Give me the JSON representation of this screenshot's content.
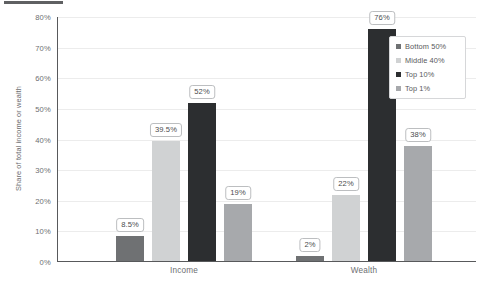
{
  "chart_data": {
    "type": "bar",
    "title": "",
    "xlabel": "",
    "ylabel": "Share of total income or wealth",
    "categories": [
      "Income",
      "Wealth"
    ],
    "series": [
      {
        "name": "Bottom 50%",
        "color": "#6f7173",
        "values": [
          8.5,
          2
        ],
        "labels": [
          "8.5%",
          "2%"
        ]
      },
      {
        "name": "Middle 40%",
        "color": "#d0d2d3",
        "values": [
          39.5,
          22
        ],
        "labels": [
          "39.5%",
          "22%"
        ]
      },
      {
        "name": "Top 10%",
        "color": "#2c2e30",
        "values": [
          52,
          76
        ],
        "labels": [
          "52%",
          "76%"
        ]
      },
      {
        "name": "Top 1%",
        "color": "#a7a9ac",
        "values": [
          19,
          38
        ],
        "labels": [
          "19%",
          "38%"
        ]
      }
    ],
    "ylim": [
      0,
      80
    ],
    "y_ticks": [
      "0%",
      "10%",
      "20%",
      "30%",
      "40%",
      "50%",
      "60%",
      "70%",
      "80%"
    ],
    "y_tick_values": [
      0,
      10,
      20,
      30,
      40,
      50,
      60,
      70,
      80
    ],
    "grid": true,
    "legend_position": "upper right"
  },
  "legend": {
    "items": [
      {
        "label": "Bottom 50%",
        "color": "#6f7173"
      },
      {
        "label": "Middle 40%",
        "color": "#d0d2d3"
      },
      {
        "label": "Top 10%",
        "color": "#2c2e30"
      },
      {
        "label": "Top 1%",
        "color": "#a7a9ac"
      }
    ]
  }
}
